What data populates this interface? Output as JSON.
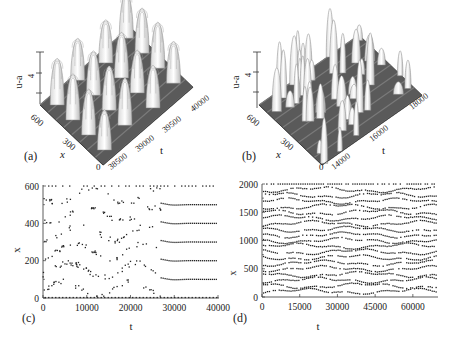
{
  "figure": {
    "panels": [
      {
        "id": "a",
        "label": "(a)",
        "type": "surface3d",
        "zlabel": "u-a",
        "ztick": "4",
        "xlabel": "x",
        "xticks": [
          "600",
          "300",
          "0"
        ],
        "tlabel": "t",
        "tticks": [
          "38500",
          "39000",
          "39500",
          "40000"
        ]
      },
      {
        "id": "b",
        "label": "(b)",
        "type": "surface3d",
        "zlabel": "u-a",
        "ztick": "4",
        "xlabel": "x",
        "xticks": [
          "600",
          "300",
          "0"
        ],
        "tlabel": "t",
        "tticks": [
          "14000",
          "16000",
          "18000"
        ]
      },
      {
        "id": "c",
        "label": "(c)",
        "type": "scatter",
        "xlabel": "t",
        "ylabel": "x",
        "xticks": [
          "0",
          "10000",
          "20000",
          "30000",
          "40000"
        ],
        "yticks": [
          "0",
          "200",
          "400",
          "600"
        ]
      },
      {
        "id": "d",
        "label": "(d)",
        "type": "scatter",
        "xlabel": "t",
        "ylabel": "x",
        "xticks": [
          "0",
          "15000",
          "30000",
          "45000",
          "60000"
        ],
        "yticks": [
          "0",
          "500",
          "1000",
          "1500",
          "2000"
        ]
      }
    ]
  },
  "chart_data": [
    {
      "panel": "a",
      "type": "surface3d",
      "title": "",
      "xlabel": "x",
      "ylabel": "t",
      "zlabel": "u-a",
      "xlim": [
        0,
        600
      ],
      "tlim": [
        38500,
        40000
      ],
      "zticks": [
        4
      ],
      "description": "Regular lattice of tall spikes (~4x4 grid) on a ridged surface"
    },
    {
      "panel": "b",
      "type": "surface3d",
      "title": "",
      "xlabel": "x",
      "ylabel": "t",
      "zlabel": "u-a",
      "xlim": [
        0,
        600
      ],
      "tlim": [
        14000,
        18000
      ],
      "zticks": [
        4
      ],
      "description": "Irregular, spatiotemporally chaotic spikes of varying heights"
    },
    {
      "panel": "c",
      "type": "scatter",
      "xlabel": "t",
      "ylabel": "x",
      "xlim": [
        0,
        40000
      ],
      "ylim": [
        0,
        600
      ],
      "xticks": [
        0,
        10000,
        20000,
        30000,
        40000
      ],
      "yticks": [
        0,
        200,
        400,
        600
      ],
      "description": "Spike positions: irregular diagonal drift for t<27000, then six steady horizontal rows",
      "steady_rows_after_t27000": [
        100,
        200,
        300,
        400,
        500,
        600
      ],
      "boundary_rows": [
        0,
        600
      ]
    },
    {
      "panel": "d",
      "type": "scatter",
      "xlabel": "t",
      "ylabel": "x",
      "xlim": [
        0,
        70000
      ],
      "ylim": [
        0,
        2000
      ],
      "xticks": [
        0,
        15000,
        30000,
        45000,
        60000
      ],
      "yticks": [
        0,
        500,
        1000,
        1500,
        2000
      ],
      "description": "Dense wavy rows of spike positions (~20 rows) persisting for all t",
      "row_spacing": 100,
      "boundary_rows": [
        0,
        2000
      ]
    }
  ]
}
